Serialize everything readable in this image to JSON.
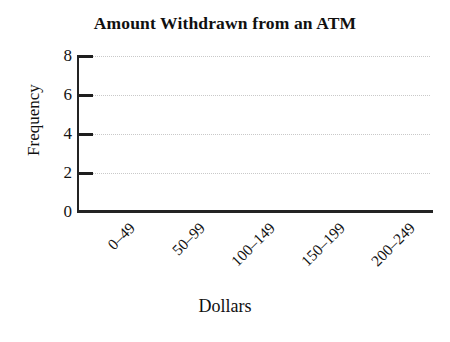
{
  "chart_data": {
    "type": "bar",
    "title": "Amount Withdrawn from an ATM",
    "xlabel": "Dollars",
    "ylabel": "Frequency",
    "categories": [
      "0–49",
      "50–99",
      "100–149",
      "150–199",
      "200–249"
    ],
    "values": [
      null,
      null,
      null,
      null,
      null
    ],
    "series": [
      {
        "name": "Frequency",
        "values": [
          null,
          null,
          null,
          null,
          null
        ]
      }
    ],
    "ylim": [
      0,
      8
    ],
    "yticks": [
      0,
      2,
      4,
      6,
      8
    ],
    "ytick_labels": [
      "0",
      "2",
      "4",
      "6",
      "8"
    ],
    "grid": "horizontal-dotted",
    "gridlines_at": [
      2,
      4,
      6,
      8
    ],
    "legend": null,
    "legend_position": "none",
    "note": "Empty histogram template — axes and gridlines drawn, no bars plotted",
    "colors": {
      "background": "#ffffff",
      "axis": "#232323",
      "gridline": "#c9c9c9",
      "text": "#141414",
      "title": "#101010"
    }
  }
}
